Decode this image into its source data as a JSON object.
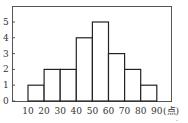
{
  "chart_data": {
    "type": "bar",
    "subtype": "histogram",
    "title": "",
    "xlabel": "(点)",
    "ylabel": "",
    "bin_edges": [
      10,
      20,
      30,
      40,
      50,
      60,
      70,
      80,
      90
    ],
    "categories": [
      "10-20",
      "20-30",
      "30-40",
      "40-50",
      "50-60",
      "60-70",
      "70-80",
      "80-90"
    ],
    "values": [
      1,
      2,
      2,
      4,
      5,
      3,
      2,
      1
    ],
    "x_tick_labels": [
      "10",
      "20",
      "30",
      "40",
      "50",
      "60",
      "70",
      "80",
      "90"
    ],
    "y_tick_labels": [
      "0",
      "1",
      "2",
      "3",
      "4",
      "5"
    ],
    "ylim": [
      0,
      5.8
    ],
    "grid": false,
    "legend": null
  },
  "footnote": "."
}
